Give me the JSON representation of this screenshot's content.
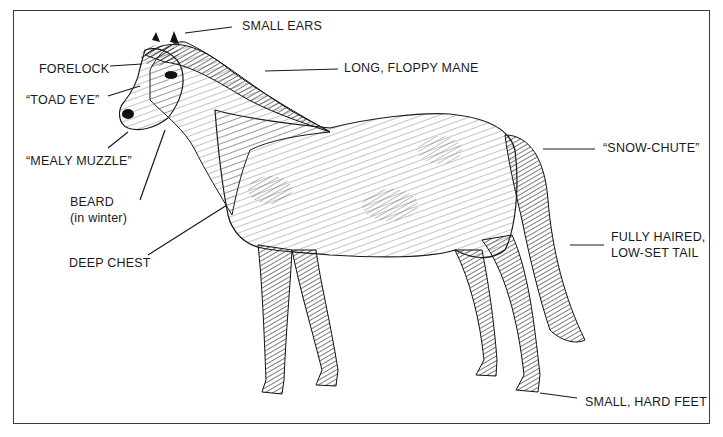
{
  "diagram": {
    "labels": {
      "small_ears": "SMALL EARS",
      "forelock": "FORELOCK",
      "long_floppy_mane": "LONG, FLOPPY MANE",
      "toad_eye": "“TOAD EYE”",
      "mealy_muzzle": "“MEALY MUZZLE”",
      "beard_line1": "BEARD",
      "beard_line2": "(in winter)",
      "deep_chest": "DEEP CHEST",
      "snow_chute": "“SNOW-CHUTE”",
      "tail_line1": "FULLY HAIRED,",
      "tail_line2": "LOW-SET TAIL",
      "small_hard_feet": "SMALL, HARD FEET"
    },
    "colors": {
      "ink": "#1a1a1a",
      "background": "#ffffff",
      "frame": "#3a3a3a"
    }
  }
}
